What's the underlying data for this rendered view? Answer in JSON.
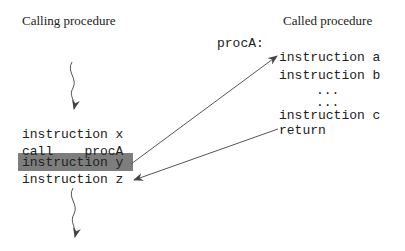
{
  "calling": {
    "title": "Calling procedure",
    "lines": [
      "instruction x",
      "call    procA",
      "instruction y",
      "instruction z"
    ],
    "highlighted_line": "instruction y",
    "highlight_color": "#7d7d7d"
  },
  "called": {
    "title": "Called procedure",
    "label": "procA:",
    "lines": [
      "instruction a",
      "instruction b",
      "...",
      "...",
      "instruction c",
      "return"
    ]
  },
  "arrows": [
    {
      "name": "call-arrow",
      "from": "instruction y",
      "to": "instruction a"
    },
    {
      "name": "return-arrow",
      "from": "return",
      "to": "instruction z"
    }
  ],
  "flow": [
    {
      "name": "incoming-flow",
      "direction": "down"
    },
    {
      "name": "outgoing-flow",
      "direction": "down"
    }
  ]
}
